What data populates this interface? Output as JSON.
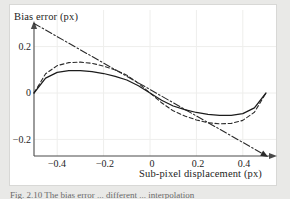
{
  "figure": {
    "background_color": "#e9e9e7",
    "plot_background_color": "#ffffff",
    "frame_border_color": "#d8d8d6",
    "caption_partial": "Fig. 2.10  The bias error ... different ... interpolation"
  },
  "axes": {
    "y_title": "Bias error (px)",
    "x_title": "Sub-pixel displacement (px)",
    "x_ticks": [
      {
        "label": "−0.4",
        "value": -0.4,
        "px": 57
      },
      {
        "label": "−0.2",
        "value": -0.2,
        "px": 105
      },
      {
        "label": "0",
        "value": 0,
        "px": 152
      },
      {
        "label": "0.2",
        "value": 0.2,
        "px": 198
      },
      {
        "label": "0.4",
        "value": 0.4,
        "px": 244
      }
    ],
    "y_ticks": [
      {
        "label": "0.2",
        "value": 0.2,
        "px": 47
      },
      {
        "label": "0",
        "value": 0,
        "px": 93
      },
      {
        "label": "−0.2",
        "value": -0.2,
        "px": 140
      }
    ],
    "axis_color": "#4a4a4a",
    "grid_color": "#eeeeec"
  },
  "chart_data": {
    "type": "line",
    "title": "",
    "xlabel": "Sub-pixel displacement (px)",
    "ylabel": "Bias error (px)",
    "xlim": [
      -0.5,
      0.5
    ],
    "ylim": [
      -0.272,
      0.32
    ],
    "grid": true,
    "legend": "none",
    "x": [
      -0.5,
      -0.45,
      -0.4,
      -0.35,
      -0.3,
      -0.25,
      -0.2,
      -0.15,
      -0.1,
      -0.05,
      0.0,
      0.05,
      0.1,
      0.15,
      0.2,
      0.25,
      0.3,
      0.35,
      0.4,
      0.45,
      0.5
    ],
    "series": [
      {
        "name": "linear-interpolation-bias",
        "style": "dash-dot",
        "color": "#2b2b2b",
        "arrow_end": true,
        "values": [
          0.3,
          0.2715,
          0.243,
          0.2145,
          0.186,
          0.1575,
          0.129,
          0.1005,
          0.072,
          0.0435,
          0.015,
          -0.0135,
          -0.042,
          -0.0705,
          -0.099,
          -0.1275,
          -0.156,
          -0.1845,
          -0.213,
          -0.2415,
          -0.27
        ]
      },
      {
        "name": "dashed-interpolation-bias",
        "style": "dashed",
        "color": "#2b2b2b",
        "arrow_end": false,
        "values": [
          0.0,
          0.083,
          0.118,
          0.131,
          0.133,
          0.128,
          0.116,
          0.099,
          0.077,
          0.042,
          0.0,
          -0.042,
          -0.077,
          -0.099,
          -0.116,
          -0.128,
          -0.133,
          -0.131,
          -0.118,
          -0.083,
          0.0
        ]
      },
      {
        "name": "solid-interpolation-bias",
        "style": "solid",
        "color": "#1c1c1c",
        "arrow_end": false,
        "values": [
          0.0,
          0.064,
          0.089,
          0.096,
          0.096,
          0.092,
          0.084,
          0.072,
          0.056,
          0.031,
          0.0,
          -0.031,
          -0.056,
          -0.072,
          -0.084,
          -0.092,
          -0.096,
          -0.096,
          -0.089,
          -0.064,
          0.0
        ]
      }
    ]
  }
}
